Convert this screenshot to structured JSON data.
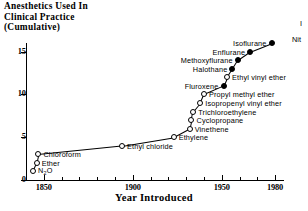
{
  "chart_data": {
    "type": "scatter",
    "title": "Anesthetics Used In\nClinical Practice\n(Cumulative)",
    "xlabel": "Year Introduced",
    "ylabel": "",
    "xlim": [
      1840,
      1985
    ],
    "ylim": [
      0,
      16
    ],
    "xticks": [
      1850,
      1900,
      1950,
      1980
    ],
    "xticklabels": [
      "1850",
      "1900",
      "1950",
      "1980"
    ],
    "xminorticks": [
      1860,
      1870,
      1880,
      1890,
      1910,
      1920,
      1930,
      1940,
      1960,
      1970
    ],
    "yticks": [
      0,
      5,
      10,
      15
    ],
    "yticklabels": [
      "0",
      "5",
      "10",
      "15"
    ],
    "grid": false,
    "legend": null,
    "marker_legend": {
      "open": "open circle",
      "filled": "filled circle"
    },
    "points": [
      {
        "name": "N₂O",
        "x": 1844,
        "y": 1,
        "marker": "open",
        "label": "N2O",
        "label_side": "right"
      },
      {
        "name": "Ether",
        "x": 1846,
        "y": 2,
        "marker": "open",
        "label": "Ether",
        "label_side": "right"
      },
      {
        "name": "Chloroform",
        "x": 1847,
        "y": 3,
        "marker": "open",
        "label": "Chloroform",
        "label_side": "right"
      },
      {
        "name": "Ethyl chloride",
        "x": 1894,
        "y": 4,
        "marker": "open",
        "label": "Ethyl chloride",
        "label_side": "right"
      },
      {
        "name": "Ethylene",
        "x": 1923,
        "y": 5,
        "marker": "open",
        "label": "Ethylene",
        "label_side": "right"
      },
      {
        "name": "Vinethene",
        "x": 1932,
        "y": 6,
        "marker": "open",
        "label": "Vinethene",
        "label_side": "right"
      },
      {
        "name": "Cyclopropane",
        "x": 1933,
        "y": 7,
        "marker": "open",
        "label": "Cyclopropane",
        "label_side": "right"
      },
      {
        "name": "Trichloroethylene",
        "x": 1934,
        "y": 8,
        "marker": "open",
        "label": "Trichloroethylene",
        "label_side": "right"
      },
      {
        "name": "Isopropenyl vinyl ether",
        "x": 1938,
        "y": 9,
        "marker": "open",
        "label": "Isopropenyl vinyl ether",
        "label_side": "right"
      },
      {
        "name": "Propyl methyl ether",
        "x": 1940,
        "y": 10,
        "marker": "open",
        "label": "Propyl methyl ether",
        "label_side": "right"
      },
      {
        "name": "Fluroxene",
        "x": 1951,
        "y": 11,
        "marker": "filled",
        "label": "Fluroxene",
        "label_side": "left"
      },
      {
        "name": "Ethyl vinyl ether",
        "x": 1953,
        "y": 12,
        "marker": "open",
        "label": "Ethyl vinyl ether",
        "label_side": "right"
      },
      {
        "name": "Halothane",
        "x": 1956,
        "y": 13,
        "marker": "filled",
        "label": "Halothane",
        "label_side": "left"
      },
      {
        "name": "Methoxyflurane",
        "x": 1959,
        "y": 14,
        "marker": "filled",
        "label": "Methoxyflurane",
        "label_side": "left"
      },
      {
        "name": "Enflurane",
        "x": 1966,
        "y": 15,
        "marker": "filled",
        "label": "Enflurane",
        "label_side": "left"
      },
      {
        "name": "Isoflurane",
        "x": 1978,
        "y": 16,
        "marker": "filled",
        "label": "Isoflurane",
        "label_side": "left"
      }
    ],
    "annotations": [
      {
        "text": "Nit",
        "note": "text clipped at right edge of image",
        "x_px": 292,
        "y_px": 35
      },
      {
        "text": "I",
        "note": "text clipped at right edge of image",
        "x_px": 300,
        "y_px": 19
      }
    ]
  }
}
